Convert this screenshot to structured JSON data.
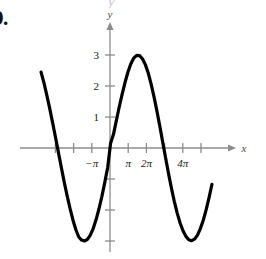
{
  "figure": {
    "problem_number": "9.",
    "top_artifact_text": "y",
    "axes": {
      "x_axis_label": "x",
      "y_axis_label": "y",
      "x_tick_labels": [
        {
          "text": "−π",
          "x_value": -3.14159
        },
        {
          "text": "π",
          "x_value": 3.14159
        },
        {
          "text": "2π",
          "x_value": 6.28319
        },
        {
          "text": "4π",
          "x_value": 12.56637
        }
      ],
      "y_tick_labels": [
        {
          "text": "1",
          "y_value": 1
        },
        {
          "text": "2",
          "y_value": 2
        },
        {
          "text": "3",
          "y_value": 3
        }
      ],
      "unlabeled_y_ticks": [
        -1,
        -2,
        -3
      ],
      "unlabeled_x_ticks": [
        -9.42478,
        -6.28319,
        0,
        9.42478,
        15.70796
      ],
      "axis_color": "#8c8c8c",
      "curve_color": "#000000",
      "tick_spacing_units": 3.14159
    }
  },
  "chart_data": {
    "type": "line",
    "title": "",
    "subtitle": "",
    "xlabel": "x",
    "ylabel": "y",
    "grid": false,
    "legend": null,
    "function": "y = 3 sin(x/2)",
    "amplitude": 3,
    "period": 12.56637,
    "xlim": [
      -11.9,
      17.6
    ],
    "ylim": [
      -4.1,
      3.6
    ],
    "x_tick_values": [
      -9.42478,
      -6.28319,
      -3.14159,
      0,
      3.14159,
      6.28319,
      9.42478,
      12.56637,
      15.70796
    ],
    "y_tick_values": [
      -3,
      -2,
      -1,
      1,
      2,
      3
    ],
    "key_points": [
      {
        "label": "left-edge-start",
        "x": -11.9,
        "y": 2.45
      },
      {
        "label": "zero-crossing",
        "x": -9.42478,
        "y": 0
      },
      {
        "label": "minimum",
        "x": -3.14159,
        "y": -3
      },
      {
        "label": "zero-crossing",
        "x": 0.0,
        "y": 0
      },
      {
        "label": "maximum",
        "x": 3.14159,
        "y": 3
      },
      {
        "label": "zero-crossing",
        "x": 6.28319,
        "y": 0
      },
      {
        "label": "minimum",
        "x": 12.56637,
        "y": -3
      },
      {
        "label": "zero-crossing",
        "x": 15.70796,
        "y": 0
      },
      {
        "label": "right-edge-end",
        "x": 17.6,
        "y": 1.75
      }
    ],
    "x": [
      -11.9,
      -11.4,
      -10.9,
      -10.4,
      -9.9,
      -9.4,
      -8.9,
      -8.4,
      -7.9,
      -7.4,
      -6.9,
      -6.4,
      -5.9,
      -5.4,
      -4.9,
      -4.4,
      -3.9,
      -3.4,
      -2.9,
      -2.4,
      -1.9,
      -1.4,
      -0.9,
      -0.4,
      0.1,
      0.6,
      1.1,
      1.6,
      2.1,
      2.6,
      3.1,
      3.6,
      4.1,
      4.6,
      5.1,
      5.6,
      6.1,
      6.6,
      7.1,
      7.6,
      8.1,
      8.6,
      9.1,
      9.6,
      10.1,
      10.6,
      11.1,
      11.6,
      12.1,
      12.6,
      13.1,
      13.6,
      14.1,
      14.6,
      15.1,
      15.6,
      16.1,
      16.6,
      17.1,
      17.6
    ],
    "y": [
      2.45,
      2.1,
      1.7,
      1.27,
      0.81,
      0.34,
      -0.15,
      -0.63,
      -1.1,
      -1.54,
      -1.95,
      -2.32,
      -2.63,
      -2.87,
      -2.97,
      -3.0,
      -2.95,
      -2.81,
      -2.6,
      -2.31,
      -1.96,
      -1.56,
      -1.11,
      -0.63,
      0.15,
      0.44,
      0.89,
      1.33,
      1.74,
      2.12,
      2.45,
      2.72,
      2.9,
      2.99,
      2.98,
      2.88,
      2.69,
      2.42,
      2.06,
      1.65,
      1.19,
      0.7,
      0.19,
      -0.32,
      -0.82,
      -1.29,
      -1.72,
      -2.1,
      -2.42,
      -2.67,
      -2.85,
      -2.96,
      -2.99,
      -2.94,
      -2.81,
      -2.6,
      -2.33,
      -1.99,
      -1.6,
      -1.17
    ]
  }
}
